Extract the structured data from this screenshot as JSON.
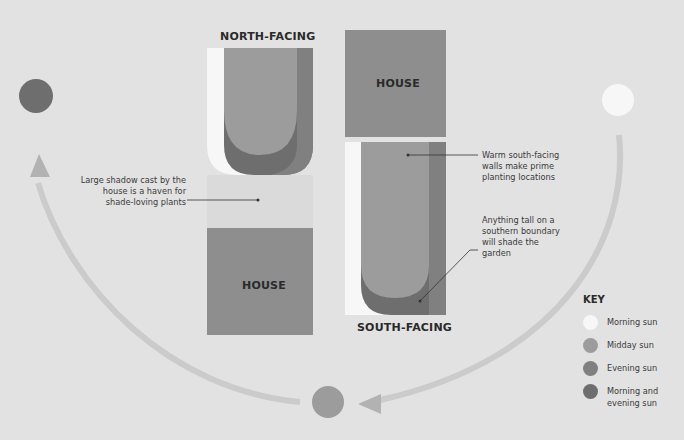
{
  "colors": {
    "background": "#e2e2e2",
    "morning_sun": "#f7f7f7",
    "midday_sun": "#9c9c9c",
    "evening_sun": "#808080",
    "morning_and_evening_sun": "#6e6e6e",
    "house": "#8e8e8e",
    "shadow": "#dadada",
    "arc": "#c9c9c9"
  },
  "labels": {
    "north_facing": "NORTH-FACING",
    "south_facing": "SOUTH-FACING",
    "house_top": "HOUSE",
    "house_bottom": "HOUSE"
  },
  "annotations": {
    "shade": "Large shadow cast by the house is a haven for shade-loving plants",
    "warm_walls": "Warm south-facing walls make prime planting locations",
    "tall_boundary": "Anything tall on a southern boundary will shade the garden"
  },
  "key": {
    "title": "KEY",
    "items": [
      {
        "label": "Morning sun",
        "color_ref": "morning_sun"
      },
      {
        "label": "Midday sun",
        "color_ref": "midday_sun"
      },
      {
        "label": "Evening sun",
        "color_ref": "evening_sun"
      },
      {
        "label": "Morning and evening sun",
        "color_ref": "morning_and_evening_sun"
      }
    ]
  },
  "sun_positions": [
    {
      "name": "morning",
      "color_ref": "morning_sun"
    },
    {
      "name": "midday",
      "color_ref": "midday_sun"
    },
    {
      "name": "evening",
      "color_ref": "morning_and_evening_sun"
    }
  ]
}
